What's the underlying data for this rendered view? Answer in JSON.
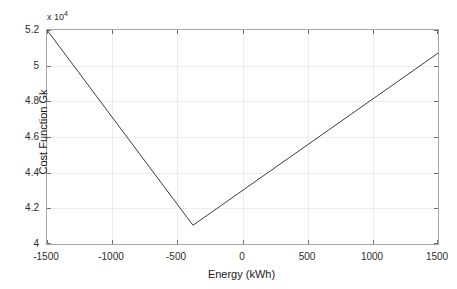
{
  "chart_data": {
    "type": "line",
    "title": "",
    "xlabel": "Energy (kWh)",
    "ylabel": "Cost Function Gk",
    "exponent_label": "x 10",
    "exponent_value": "4",
    "y_scale_factor": 10000,
    "xlim": [
      -1500,
      1500
    ],
    "ylim": [
      40000,
      52000
    ],
    "xticks": [
      -1500,
      -1000,
      -500,
      0,
      500,
      1000,
      1500
    ],
    "xticklabels": [
      "-1500",
      "-1000",
      "-500",
      "0",
      "500",
      "1000",
      "1500"
    ],
    "yticks": [
      40000,
      42000,
      44000,
      46000,
      48000,
      50000,
      52000
    ],
    "yticklabels": [
      "4",
      "4.2",
      "4.4",
      "4.6",
      "4.8",
      "5",
      "5.2"
    ],
    "grid": true,
    "legend": null,
    "line_color": "#3d3d3d",
    "line_width": 1,
    "series": [
      {
        "name": "Cost Function Gk",
        "x": [
          -1500,
          -380,
          1500
        ],
        "values": [
          52000,
          41050,
          50700
        ]
      }
    ],
    "annotations": []
  }
}
